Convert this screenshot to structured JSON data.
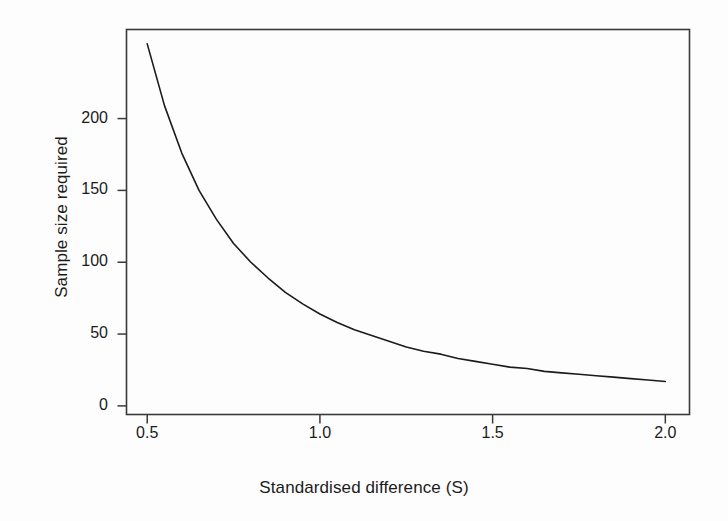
{
  "chart_data": {
    "type": "line",
    "title": "",
    "xlabel": "Standardised difference (S)",
    "ylabel": "Sample size required",
    "xlim": [
      0.44,
      2.07
    ],
    "ylim": [
      -6,
      262
    ],
    "xticks": [
      0.5,
      1.0,
      1.5,
      2.0
    ],
    "xtick_labels": [
      "0.5",
      "1.0",
      "1.5",
      "2.0"
    ],
    "yticks": [
      0,
      50,
      100,
      150,
      200
    ],
    "ytick_labels": [
      "0",
      "50",
      "100",
      "150",
      "200"
    ],
    "grid": false,
    "legend": null,
    "frame": "full-box",
    "series": [
      {
        "name": "Sample size required",
        "color": "#1b1b1b",
        "linewidth": 1.6,
        "x": [
          0.5,
          0.55,
          0.6,
          0.65,
          0.7,
          0.75,
          0.8,
          0.85,
          0.9,
          0.95,
          1.0,
          1.05,
          1.1,
          1.15,
          1.2,
          1.25,
          1.3,
          1.35,
          1.4,
          1.45,
          1.5,
          1.55,
          1.6,
          1.65,
          1.7,
          1.75,
          1.8,
          1.85,
          1.9,
          1.95,
          2.0
        ],
        "values": [
          252,
          209,
          176,
          150,
          130,
          113,
          100,
          89,
          79,
          71,
          64,
          58,
          53,
          49,
          45,
          41,
          38,
          36,
          33,
          31,
          29,
          27,
          26,
          24,
          23,
          22,
          21,
          20,
          19,
          18,
          17
        ]
      }
    ],
    "annotations": []
  },
  "axes": {
    "x_title": "Standardised difference (S)",
    "y_title": "Sample size required"
  },
  "figure": {
    "background_color": "#fdfdfd",
    "line_color": "#1b1b1b",
    "frame_color": "#3a3a3a"
  }
}
